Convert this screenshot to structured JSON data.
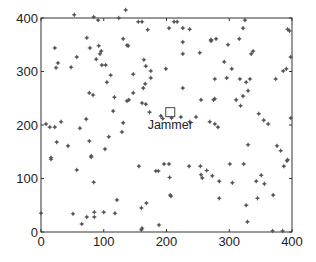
{
  "chart_data": {
    "type": "scatter",
    "title": "",
    "xlabel": "",
    "ylabel": "",
    "xlim": [
      0,
      400
    ],
    "ylim": [
      0,
      400
    ],
    "xticks": [
      0,
      100,
      200,
      300,
      400
    ],
    "yticks": [
      0,
      100,
      200,
      300,
      400
    ],
    "xtick_labels": [
      "0",
      "100",
      "200",
      "300",
      "400"
    ],
    "ytick_labels": [
      "0",
      "100",
      "200",
      "300",
      "400"
    ],
    "grid": false,
    "legend": null,
    "colors": {
      "points": "#555555",
      "axes": "#333333",
      "text": "#222222"
    },
    "series": [
      {
        "name": "nodes",
        "marker": "*",
        "points": [
          [
            53,
            406
          ],
          [
            84,
            402
          ],
          [
            91,
            396
          ],
          [
            124,
            400
          ],
          [
            135,
            415
          ],
          [
            73,
            363
          ],
          [
            131,
            361
          ],
          [
            22,
            344
          ],
          [
            78,
            344
          ],
          [
            92,
            348
          ],
          [
            96,
            338
          ],
          [
            94,
            333
          ],
          [
            57,
            327
          ],
          [
            88,
            323
          ],
          [
            27,
            316
          ],
          [
            24,
            307
          ],
          [
            48,
            308
          ],
          [
            97,
            312
          ],
          [
            103,
            312
          ],
          [
            111,
            293
          ],
          [
            105,
            280
          ],
          [
            137,
            349
          ],
          [
            77,
            260
          ],
          [
            83,
            256
          ],
          [
            117,
            252
          ],
          [
            137,
            245
          ],
          [
            115,
            226
          ],
          [
            72,
            211
          ],
          [
            8,
            202
          ],
          [
            14,
            196
          ],
          [
            22,
            196
          ],
          [
            32,
            206
          ],
          [
            62,
            194
          ],
          [
            131,
            204
          ],
          [
            129,
            187
          ],
          [
            108,
            178
          ],
          [
            25,
            168
          ],
          [
            43,
            161
          ],
          [
            77,
            170
          ],
          [
            102,
            155
          ],
          [
            16,
            139
          ],
          [
            80,
            142
          ],
          [
            16,
            136
          ],
          [
            80,
            140
          ],
          [
            57,
            116
          ],
          [
            84,
            93
          ],
          [
            121,
            60
          ],
          [
            0,
            35
          ],
          [
            51,
            34
          ],
          [
            73,
            28
          ],
          [
            85,
            37
          ],
          [
            85,
            28
          ],
          [
            100,
            37
          ],
          [
            118,
            35
          ],
          [
            65,
            15
          ],
          [
            155,
            393
          ],
          [
            161,
            393
          ],
          [
            212,
            393
          ],
          [
            170,
            378
          ],
          [
            204,
            381
          ],
          [
            226,
            381
          ],
          [
            237,
            379
          ],
          [
            226,
            355
          ],
          [
            271,
            359
          ],
          [
            139,
            348
          ],
          [
            226,
            333
          ],
          [
            253,
            335
          ],
          [
            164,
            322
          ],
          [
            167,
            310
          ],
          [
            175,
            301
          ],
          [
            199,
            305
          ],
          [
            147,
            295
          ],
          [
            175,
            288
          ],
          [
            166,
            277
          ],
          [
            163,
            269
          ],
          [
            226,
            269
          ],
          [
            271,
            359
          ],
          [
            217,
            393
          ],
          [
            325,
            396
          ],
          [
            322,
            381
          ],
          [
            393,
            379
          ],
          [
            396,
            376
          ],
          [
            271,
            357
          ],
          [
            279,
            361
          ],
          [
            316,
            361
          ],
          [
            298,
            350
          ],
          [
            338,
            338
          ],
          [
            335,
            333
          ],
          [
            398,
            327
          ],
          [
            292,
            318
          ],
          [
            304,
            305
          ],
          [
            386,
            301
          ],
          [
            391,
            305
          ],
          [
            277,
            286
          ],
          [
            296,
            288
          ],
          [
            317,
            286
          ],
          [
            327,
            280
          ],
          [
            333,
            286
          ],
          [
            374,
            286
          ],
          [
            147,
            260
          ],
          [
            140,
            247
          ],
          [
            161,
            241
          ],
          [
            167,
            239
          ],
          [
            255,
            247
          ],
          [
            275,
            247
          ],
          [
            173,
            224
          ],
          [
            191,
            217
          ],
          [
            208,
            213
          ],
          [
            247,
            215
          ],
          [
            237,
            206
          ],
          [
            223,
            215
          ],
          [
            269,
            206
          ],
          [
            277,
            202
          ],
          [
            282,
            196
          ],
          [
            398,
            213
          ],
          [
            330,
            264
          ],
          [
            322,
            254
          ],
          [
            311,
            247
          ],
          [
            277,
            249
          ],
          [
            318,
            236
          ],
          [
            347,
            221
          ],
          [
            355,
            209
          ],
          [
            362,
            202
          ],
          [
            330,
            163
          ],
          [
            376,
            161
          ],
          [
            382,
            152
          ],
          [
            393,
            135
          ],
          [
            204,
            127
          ],
          [
            194,
            212
          ],
          [
            156,
            123
          ],
          [
            254,
            123
          ],
          [
            264,
            115
          ],
          [
            196,
            127
          ],
          [
            236,
            123
          ],
          [
            183,
            114
          ],
          [
            187,
            114
          ],
          [
            205,
            102
          ],
          [
            255,
            107
          ],
          [
            257,
            101
          ],
          [
            206,
            69
          ],
          [
            207,
            67
          ],
          [
            168,
            54
          ],
          [
            160,
            45
          ],
          [
            188,
            13
          ],
          [
            161,
            7
          ],
          [
            160,
            4
          ],
          [
            301,
            127
          ],
          [
            323,
            127
          ],
          [
            273,
            105
          ],
          [
            284,
            95
          ],
          [
            305,
            92
          ],
          [
            343,
            95
          ],
          [
            351,
            106
          ],
          [
            356,
            90
          ],
          [
            387,
            123
          ],
          [
            392,
            133
          ],
          [
            284,
            63
          ],
          [
            327,
            50
          ],
          [
            345,
            63
          ],
          [
            370,
            69
          ],
          [
            329,
            19
          ],
          [
            369,
            2
          ],
          [
            385,
            2
          ]
        ]
      }
    ],
    "annotations": [
      {
        "label": "Jammer",
        "x": 206,
        "y": 224,
        "marker": "square"
      }
    ]
  }
}
